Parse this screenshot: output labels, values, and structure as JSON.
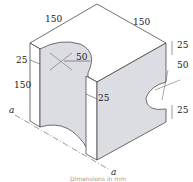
{
  "figure": {
    "type": "isometric-solid",
    "dimensions": {
      "top_left_width": "150",
      "top_right_width": "150",
      "height": "150",
      "left_wall": "25",
      "inner_radius_top": "50",
      "mid_wall": "25",
      "right_top": "25",
      "right_radius": "50",
      "right_bottom": "25"
    },
    "section_labels": {
      "start": "a",
      "end": "a"
    },
    "caption": "Dimensions in mm"
  },
  "colors": {
    "line": "#333333",
    "face_shade": "#dcdde3",
    "face_light": "#ffffff"
  }
}
